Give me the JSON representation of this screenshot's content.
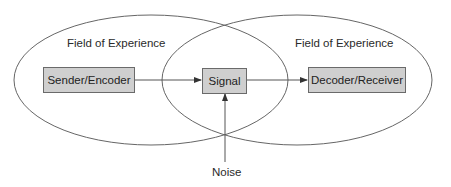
{
  "diagram": {
    "type": "communication-model",
    "fields": [
      {
        "label": "Field of Experience",
        "side": "left"
      },
      {
        "label": "Field of Experience",
        "side": "right"
      }
    ],
    "nodes": [
      {
        "id": "sender",
        "label": "Sender/Encoder"
      },
      {
        "id": "signal",
        "label": "Signal"
      },
      {
        "id": "decoder",
        "label": "Decoder/Receiver"
      }
    ],
    "noise": {
      "label": "Noise"
    },
    "edges": [
      {
        "from": "sender",
        "to": "signal"
      },
      {
        "from": "signal",
        "to": "decoder"
      },
      {
        "from": "noise",
        "to": "signal"
      }
    ],
    "colors": {
      "box_fill": "#cfcfcf",
      "box_border": "#6a6a6a",
      "line": "#555555",
      "text": "#2a2a2a"
    }
  }
}
